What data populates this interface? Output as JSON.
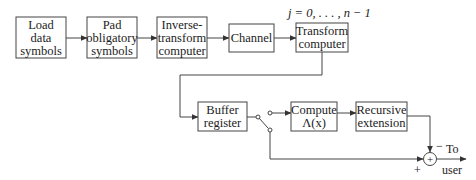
{
  "diagram": {
    "blocks": [
      {
        "id": "load",
        "lines": [
          "Load",
          "data",
          "symbols"
        ]
      },
      {
        "id": "pad",
        "lines": [
          "Pad",
          "obligatory",
          "symbols"
        ]
      },
      {
        "id": "inverse",
        "lines": [
          "Inverse-",
          "transform",
          "computer"
        ]
      },
      {
        "id": "channel",
        "lines": [
          "Channel"
        ]
      },
      {
        "id": "transform",
        "lines": [
          "Transform",
          "computer"
        ]
      },
      {
        "id": "buffer",
        "lines": [
          "Buffer",
          "register"
        ]
      },
      {
        "id": "compute",
        "lines": [
          "Compute",
          "Λ(x)"
        ]
      },
      {
        "id": "recursive",
        "lines": [
          "Recursive",
          "extension"
        ]
      }
    ],
    "index_label": "j = 0, . . . , n − 1",
    "summer": {
      "symbol": "+",
      "minus_label": "−",
      "plus_label": "+"
    },
    "output": {
      "line1": "To",
      "line2": "user"
    }
  }
}
